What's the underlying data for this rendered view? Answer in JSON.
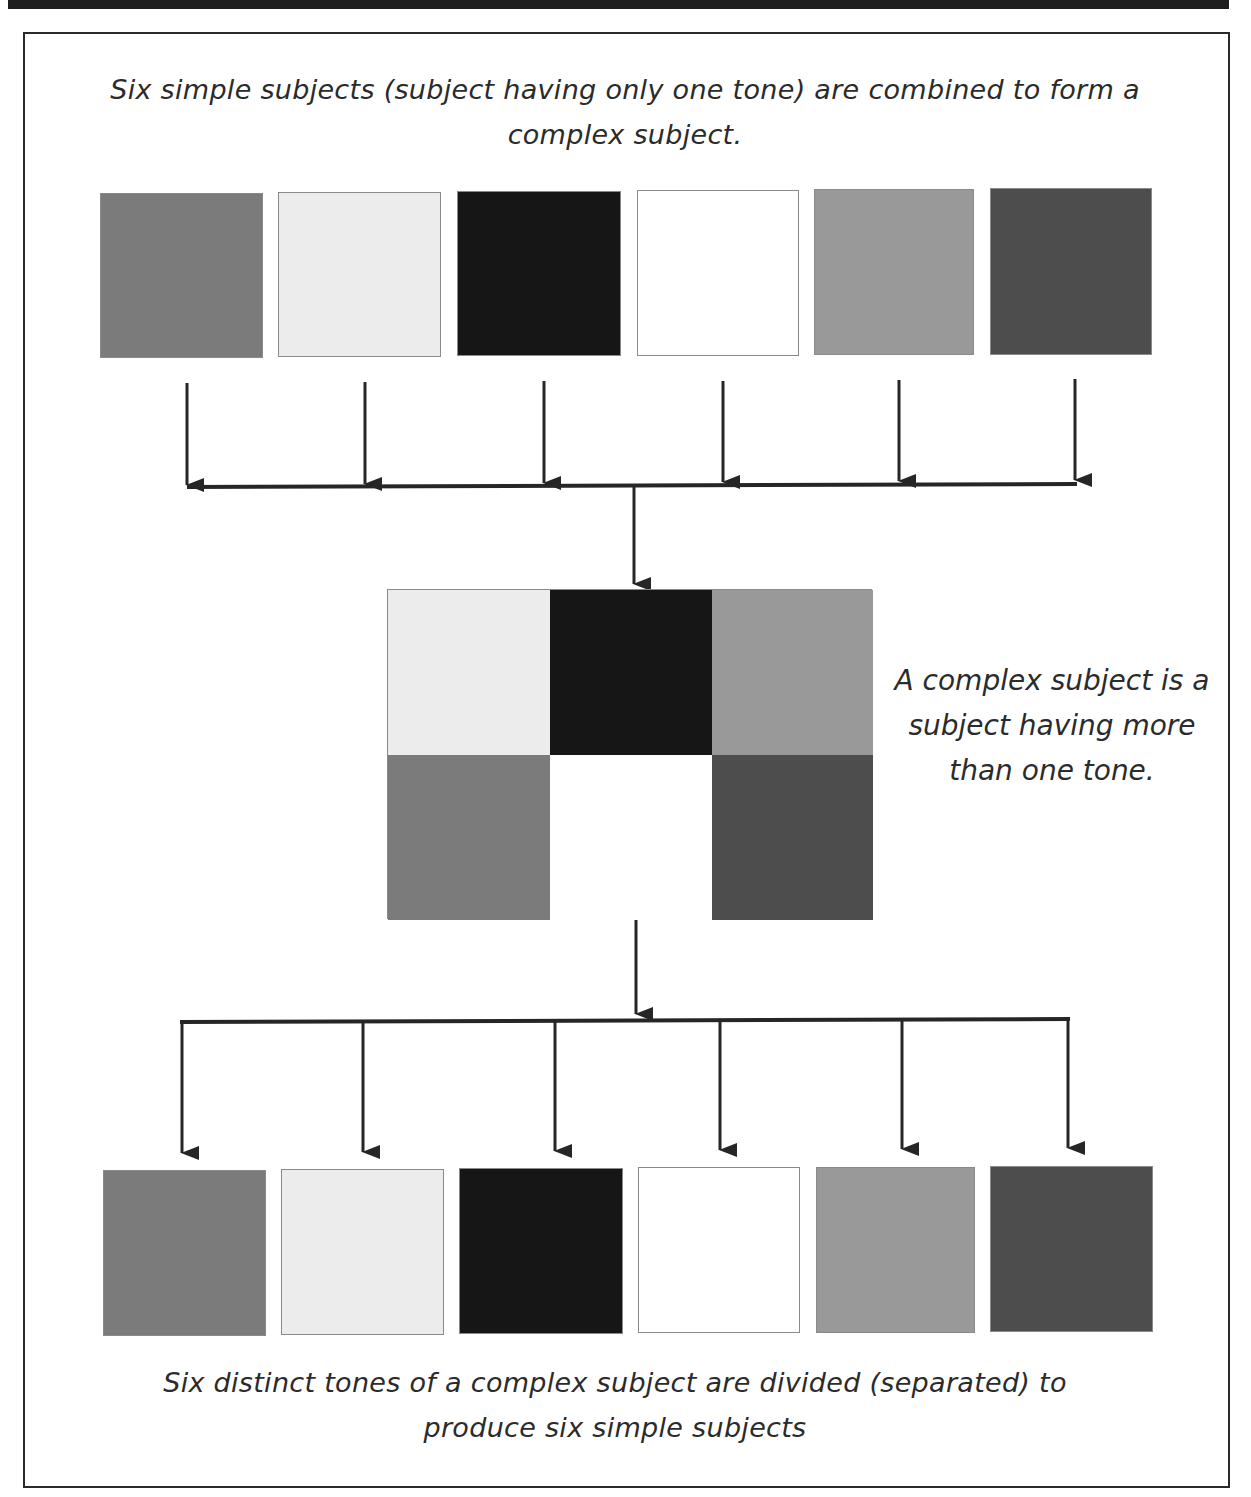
{
  "header_bar": {
    "color": "#1e1e1e"
  },
  "top_caption": {
    "line1": "Six simple subjects (subject having only one tone) are combined to form a",
    "line2": "complex subject."
  },
  "simple_subjects_top": [
    {
      "label": "medium gray",
      "color": "#7b7b7b"
    },
    {
      "label": "very light gray",
      "color": "#ececec"
    },
    {
      "label": "black",
      "color": "#161616"
    },
    {
      "label": "white",
      "color": "#ffffff"
    },
    {
      "label": "light-medium gray",
      "color": "#999999"
    },
    {
      "label": "dark gray",
      "color": "#4d4d4d"
    }
  ],
  "complex_subject": {
    "cells": [
      {
        "label": "very light gray",
        "color": "#ececec"
      },
      {
        "label": "black",
        "color": "#161616"
      },
      {
        "label": "light-medium gray",
        "color": "#999999"
      },
      {
        "label": "medium gray",
        "color": "#7b7b7b"
      },
      {
        "label": "white",
        "color": "#ffffff"
      },
      {
        "label": "dark gray",
        "color": "#4d4d4d"
      }
    ]
  },
  "side_note": {
    "line1": "A complex subject is a",
    "line2": "subject having more",
    "line3": "than one tone."
  },
  "simple_subjects_bottom": [
    {
      "label": "medium gray",
      "color": "#7b7b7b"
    },
    {
      "label": "very light gray",
      "color": "#ececec"
    },
    {
      "label": "black",
      "color": "#161616"
    },
    {
      "label": "white",
      "color": "#ffffff"
    },
    {
      "label": "light-medium gray",
      "color": "#999999"
    },
    {
      "label": "dark gray",
      "color": "#4d4d4d"
    }
  ],
  "bottom_caption": {
    "line1": "Six distinct tones of a complex subject are divided (separated) to",
    "line2": "produce six simple subjects"
  },
  "colors": {
    "arrow": "#262626",
    "frame": "#2a2a2a"
  }
}
